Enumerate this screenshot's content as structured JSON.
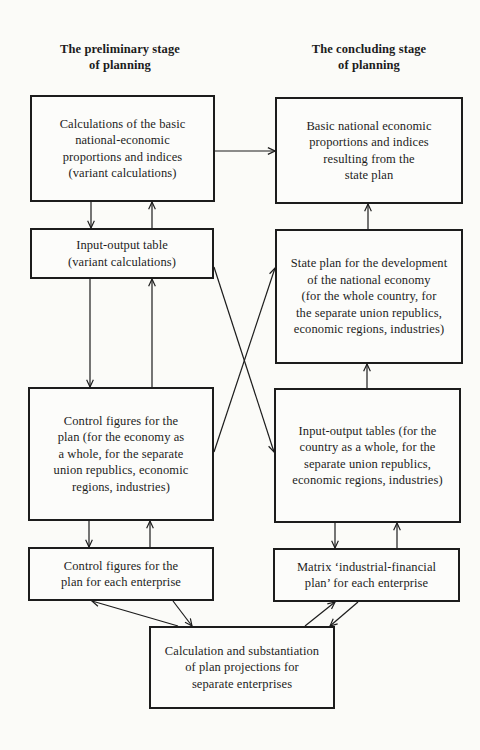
{
  "headings": {
    "preliminary": "The preliminary stage\nof planning",
    "concluding": "The concluding stage\nof planning"
  },
  "boxes": {
    "calc_basic": {
      "text": "Calculations of the basic\nnational-economic\nproportions and indices\n(variant calculations)",
      "stage": "preliminary"
    },
    "io_variant": {
      "text": "Input-output table\n(variant calculations)",
      "stage": "preliminary"
    },
    "control_figures": {
      "text": "Control figures for the\nplan (for the economy as\na whole, for the separate\nunion republics, economic\nregions, industries)",
      "stage": "preliminary"
    },
    "control_enterprise": {
      "text": "Control figures for the\nplan for each enterprise",
      "stage": "preliminary"
    },
    "basic_result": {
      "text": "Basic national economic\nproportions and indices\nresulting from the\nstate plan",
      "stage": "concluding"
    },
    "state_plan": {
      "text": "State plan for the development\nof the national economy\n(for the whole country, for\nthe separate union republics,\neconomic regions, industries)",
      "stage": "concluding"
    },
    "io_tables": {
      "text": "Input-output tables (for the\ncountry as a whole, for the\nseparate union republics,\neconomic regions, industries)",
      "stage": "concluding"
    },
    "matrix": {
      "text": "Matrix ‘industrial-financial\nplan’ for each enterprise",
      "stage": "concluding"
    },
    "calc_enterprise": {
      "text": "Calculation and substantiation\nof plan projections for\nseparate enterprises",
      "stage": "shared"
    }
  },
  "connections": [
    {
      "from": "calc_basic",
      "to": "basic_result"
    },
    {
      "from": "calc_basic",
      "to": "io_variant"
    },
    {
      "from": "io_variant",
      "to": "calc_basic"
    },
    {
      "from": "io_variant",
      "to": "control_figures"
    },
    {
      "from": "control_figures",
      "to": "io_variant"
    },
    {
      "from": "io_variant",
      "to": "io_tables"
    },
    {
      "from": "control_figures",
      "to": "state_plan"
    },
    {
      "from": "state_plan",
      "to": "basic_result"
    },
    {
      "from": "io_tables",
      "to": "state_plan"
    },
    {
      "from": "control_figures",
      "to": "control_enterprise"
    },
    {
      "from": "control_enterprise",
      "to": "control_figures"
    },
    {
      "from": "io_tables",
      "to": "matrix"
    },
    {
      "from": "matrix",
      "to": "io_tables"
    },
    {
      "from": "calc_enterprise",
      "to": "control_enterprise"
    },
    {
      "from": "control_enterprise",
      "to": "calc_enterprise"
    },
    {
      "from": "calc_enterprise",
      "to": "matrix"
    },
    {
      "from": "matrix",
      "to": "calc_enterprise"
    }
  ],
  "colors": {
    "background": "#fbfbf8",
    "ink": "#1c1c1c"
  }
}
